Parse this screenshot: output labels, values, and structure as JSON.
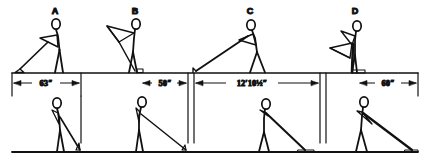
{
  "figure": {
    "title": "",
    "type": "biomechanics-stick-figure-sequence",
    "rows": 2,
    "panel_count": 4,
    "ink_color": "#111111",
    "background_color": "#ffffff"
  },
  "pose_labels": [
    {
      "name": "pose-label-a",
      "text": "A"
    },
    {
      "name": "pose-label-b",
      "text": "B"
    },
    {
      "name": "pose-label-c",
      "text": "C"
    },
    {
      "name": "pose-label-d",
      "text": "D"
    }
  ],
  "dimensions": [
    {
      "name": "dimension-63in",
      "text": "63″",
      "value": 63,
      "unit": "in"
    },
    {
      "name": "dimension-50in",
      "text": "50″",
      "value": 50,
      "unit": "in"
    },
    {
      "name": "dimension-12ft-10-5in",
      "text": "12′10½″",
      "value": 154.5,
      "unit": "in"
    },
    {
      "name": "dimension-60in",
      "text": "60″",
      "value": 60,
      "unit": "in"
    }
  ]
}
